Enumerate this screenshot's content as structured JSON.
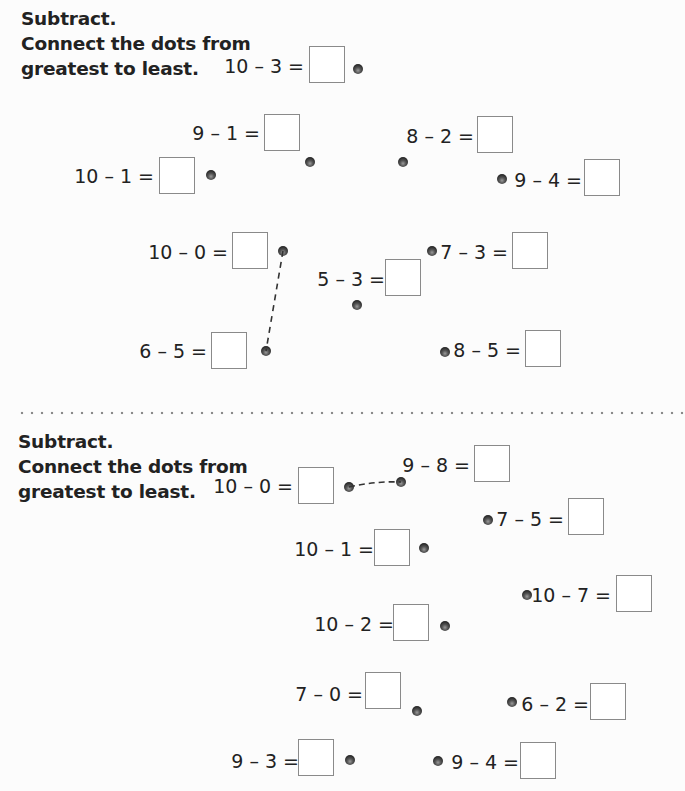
{
  "sections": [
    {
      "instructions": [
        "Subtract.",
        "Connect the dots from",
        "greatest to least."
      ],
      "problems": [
        {
          "label": "10 – 3 =",
          "answer": ""
        },
        {
          "label": "9 – 1 =",
          "answer": ""
        },
        {
          "label": "8 – 2 =",
          "answer": ""
        },
        {
          "label": "10 – 1 =",
          "answer": ""
        },
        {
          "label": "9 – 4 =",
          "answer": ""
        },
        {
          "label": "10 – 0 =",
          "answer": ""
        },
        {
          "label": "7 – 3 =",
          "answer": ""
        },
        {
          "label": "5 – 3 =",
          "answer": ""
        },
        {
          "label": "6 – 5 =",
          "answer": ""
        },
        {
          "label": "8 – 5 =",
          "answer": ""
        }
      ],
      "example_connection": {
        "from": "10 – 0",
        "to": "6 – 5",
        "style": "dashed"
      }
    },
    {
      "instructions": [
        "Subtract.",
        "Connect the dots from",
        "greatest to least."
      ],
      "problems": [
        {
          "label": "10 – 0 =",
          "answer": ""
        },
        {
          "label": "9 – 8 =",
          "answer": ""
        },
        {
          "label": "7 – 5 =",
          "answer": ""
        },
        {
          "label": "10 – 1 =",
          "answer": ""
        },
        {
          "label": "10 – 7 =",
          "answer": ""
        },
        {
          "label": "10 – 2 =",
          "answer": ""
        },
        {
          "label": "7 – 0 =",
          "answer": ""
        },
        {
          "label": "6 – 2 =",
          "answer": ""
        },
        {
          "label": "9 – 3 =",
          "answer": ""
        },
        {
          "label": "9 – 4 =",
          "answer": ""
        }
      ],
      "example_connection": {
        "from": "10 – 0",
        "to": "9 – 8",
        "style": "dashed"
      }
    }
  ],
  "colors": {
    "background": "#fcfcfc",
    "text": "#222222",
    "box_border": "#8a8a8a",
    "dot": "#2a2a2a",
    "divider": "#8a8a8a"
  }
}
